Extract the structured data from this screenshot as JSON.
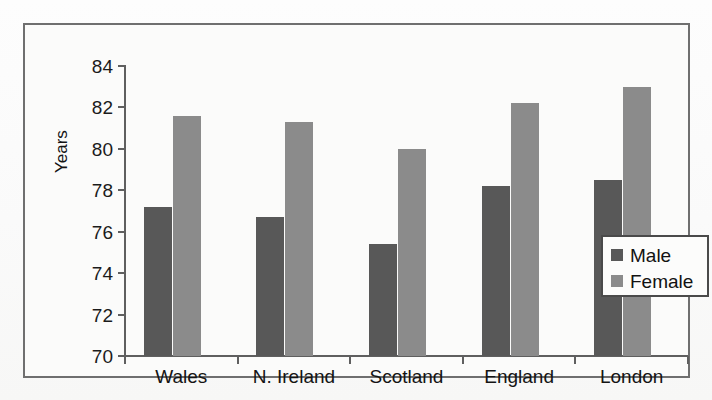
{
  "chart_data": {
    "type": "bar",
    "title": "",
    "subtitle": "",
    "xlabel": "",
    "ylabel": "Years",
    "categories": [
      "Wales",
      "N. Ireland",
      "Scotland",
      "England",
      "London"
    ],
    "series": [
      {
        "name": "Male",
        "color": "#585858",
        "values": [
          77.2,
          76.7,
          75.4,
          78.2,
          78.5
        ]
      },
      {
        "name": "Female",
        "color": "#8b8b8b",
        "values": [
          81.6,
          81.3,
          80.0,
          82.2,
          83.0
        ]
      }
    ],
    "ylim": [
      70,
      84
    ],
    "ytick_step": 2,
    "ytick_labels": [
      "84",
      "82",
      "80",
      "78",
      "76",
      "74",
      "72",
      "70"
    ],
    "grid": false,
    "legend_position": "inside-right",
    "legend_entries": [
      "Male",
      "Female"
    ]
  },
  "axis": {
    "y_title": "Years"
  },
  "legend": {
    "male_label": "Male",
    "female_label": "Female"
  }
}
